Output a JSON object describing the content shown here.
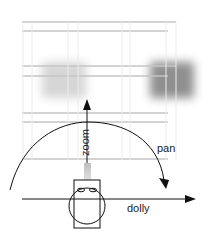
{
  "diagram": {
    "labels": {
      "zoom": "zoom",
      "pan": "pan",
      "dolly": "dolly"
    },
    "colors": {
      "line": "#111111",
      "grid": "#c8c8c8",
      "blur_left": "#d2d2d2",
      "blur_right": "#9a9a9a",
      "lens_gradient_top": "#bdbdbd",
      "lens_gradient_bottom": "#e0e0e0"
    }
  }
}
